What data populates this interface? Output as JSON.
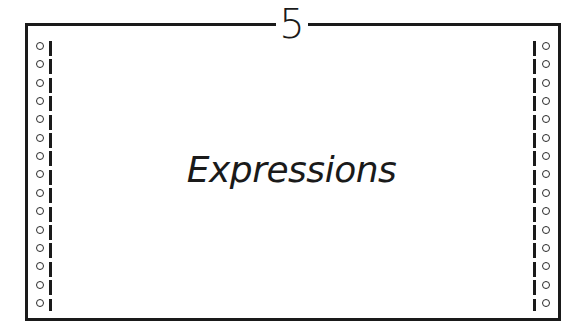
{
  "page": {
    "chapter_number": "5",
    "chapter_title": "Expressions"
  },
  "decoration": {
    "style": "continuous-feed printer paper frame",
    "holes_per_side": 15,
    "border_color": "#1a1a1a",
    "background_color": "#ffffff"
  }
}
